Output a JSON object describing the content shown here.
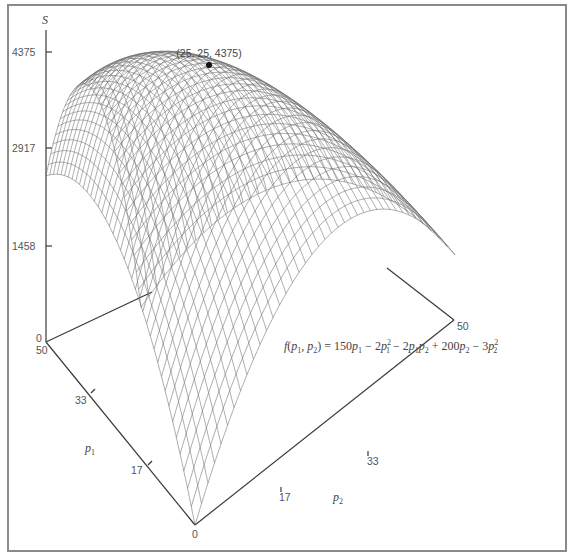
{
  "chart_data": {
    "type": "surface3d",
    "title": "",
    "function_label": "f(p1, p2) = 150p1 − 2p1² − 2p1p2 + 200p2 − 3p2²",
    "function": {
      "p1": 150,
      "p1^2": -2,
      "p1p2": -2,
      "p2": 200,
      "p2^2": -3
    },
    "x_axis": {
      "name": "p1",
      "range": [
        0,
        50
      ],
      "ticks": [
        0,
        17,
        33,
        50
      ]
    },
    "y_axis": {
      "name": "p2",
      "range": [
        0,
        50
      ],
      "ticks": [
        0,
        17,
        33,
        50
      ]
    },
    "z_axis": {
      "name": "S",
      "range": [
        0,
        4375
      ],
      "ticks": [
        0,
        1458,
        2917,
        4375
      ]
    },
    "maximum": {
      "p1": 25,
      "p2": 25,
      "S": 4375,
      "label": "(25, 25, 4375)"
    },
    "grid": true,
    "mesh_divisions": 40,
    "sample_points": [
      {
        "p1": 0,
        "p2": 0,
        "S": 0
      },
      {
        "p1": 50,
        "p2": 0,
        "S": 2500
      },
      {
        "p1": 0,
        "p2": 50,
        "S": 2500
      },
      {
        "p1": 25,
        "p2": 25,
        "S": 4375
      },
      {
        "p1": 50,
        "p2": 50,
        "S": 0
      }
    ]
  },
  "labels": {
    "s_axis": "S",
    "p1_axis": "p",
    "p1_sub": "1",
    "p2_axis": "p",
    "p2_sub": "2",
    "s_ticks": [
      "4375",
      "2917",
      "1458",
      "0"
    ],
    "p1_ticks": [
      "50",
      "33",
      "17"
    ],
    "p2_ticks": [
      "17",
      "33",
      "50"
    ],
    "origin": "0",
    "max_point": "(25, 25, 4375)"
  },
  "colors": {
    "frame": "#8a8a8a",
    "axis": "#3a3a3a",
    "mesh": "#6a6a6a",
    "point": "#111111"
  }
}
